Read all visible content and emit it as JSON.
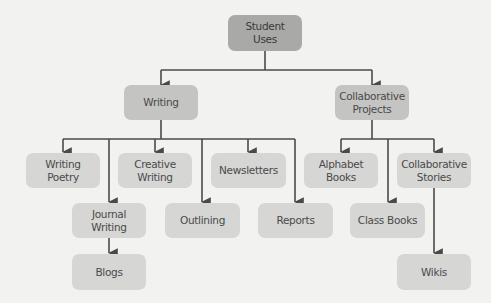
{
  "diagram": {
    "type": "tree",
    "root": {
      "id": "student_uses",
      "label": "Student\nUses"
    },
    "nodes": [
      {
        "id": "student_uses",
        "label": "Student Uses",
        "line1": "Student",
        "line2": "Uses"
      },
      {
        "id": "writing",
        "label": "Writing"
      },
      {
        "id": "collaborative_projects",
        "label": "Collaborative Projects",
        "line1": "Collaborative",
        "line2": "Projects"
      },
      {
        "id": "writing_poetry",
        "label": "Writing Poetry",
        "line1": "Writing",
        "line2": "Poetry"
      },
      {
        "id": "creative_writing",
        "label": "Creative Writing",
        "line1": "Creative",
        "line2": "Writing"
      },
      {
        "id": "newsletters",
        "label": "Newsletters"
      },
      {
        "id": "journal_writing",
        "label": "Journal Writing",
        "line1": "Journal",
        "line2": "Writing"
      },
      {
        "id": "outlining",
        "label": "Outlining"
      },
      {
        "id": "reports",
        "label": "Reports"
      },
      {
        "id": "blogs",
        "label": "Blogs"
      },
      {
        "id": "alphabet_books",
        "label": "Alphabet Books",
        "line1": "Alphabet",
        "line2": "Books"
      },
      {
        "id": "collaborative_stories",
        "label": "Collaborative Stories",
        "line1": "Collaborative",
        "line2": "Stories"
      },
      {
        "id": "class_books",
        "label": "Class Books"
      },
      {
        "id": "wikis",
        "label": "Wikis"
      }
    ],
    "edges": [
      [
        "student_uses",
        "writing"
      ],
      [
        "student_uses",
        "collaborative_projects"
      ],
      [
        "writing",
        "writing_poetry"
      ],
      [
        "writing",
        "journal_writing"
      ],
      [
        "writing",
        "creative_writing"
      ],
      [
        "writing",
        "outlining"
      ],
      [
        "writing",
        "newsletters"
      ],
      [
        "writing",
        "reports"
      ],
      [
        "journal_writing",
        "blogs"
      ],
      [
        "collaborative_projects",
        "alphabet_books"
      ],
      [
        "collaborative_projects",
        "class_books"
      ],
      [
        "collaborative_projects",
        "collaborative_stories"
      ],
      [
        "collaborative_stories",
        "wikis"
      ]
    ]
  },
  "colors": {
    "background": "#f2f2f0",
    "root_box": "#a9a9a7",
    "level1_box": "#c4c4c2",
    "leaf_box": "#d6d6d4",
    "connector": "#4a4a4a"
  },
  "labels": {
    "student_uses": {
      "l1": "Student",
      "l2": "Uses"
    },
    "writing": "Writing",
    "collaborative_projects": {
      "l1": "Collaborative",
      "l2": "Projects"
    },
    "writing_poetry": {
      "l1": "Writing",
      "l2": "Poetry"
    },
    "creative_writing": {
      "l1": "Creative",
      "l2": "Writing"
    },
    "newsletters": "Newsletters",
    "journal_writing": {
      "l1": "Journal",
      "l2": "Writing"
    },
    "outlining": "Outlining",
    "reports": "Reports",
    "blogs": "Blogs",
    "alphabet_books": {
      "l1": "Alphabet",
      "l2": "Books"
    },
    "collaborative_stories": {
      "l1": "Collaborative",
      "l2": "Stories"
    },
    "class_books": "Class Books",
    "wikis": "Wikis"
  }
}
